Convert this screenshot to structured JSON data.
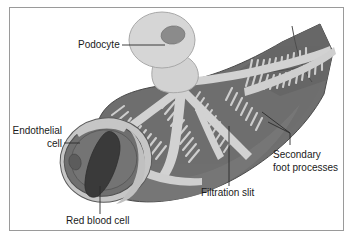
{
  "figure": {
    "frame": {
      "border_color": "#9a9a9a",
      "background": "#ffffff"
    }
  },
  "palette": {
    "capillary_dark": "#6f6f6f",
    "capillary_dark_shade": "#5e5e5e",
    "podocyte_light": "#d2d2d2",
    "podocyte_light_alt": "#c9c9c9",
    "nucleus": "#8b8b8b",
    "endothelium_ring": "#c4c4c4",
    "lumen_mid": "#7a7a7a",
    "red_blood_cell": "#3a3a3a",
    "outline": "#4a4a4a",
    "text": "#1a1a1a"
  },
  "labels": [
    {
      "id": "podocyte",
      "text": "Podocyte",
      "x": 78,
      "y": 48,
      "anchor": "start",
      "lines": [
        "Podocyte"
      ]
    },
    {
      "id": "endothelial-cell",
      "text": "Endothelial cell",
      "x": 62,
      "y": 128,
      "anchor": "end",
      "lines": [
        "Endothelial",
        "cell"
      ]
    },
    {
      "id": "red-blood-cell",
      "text": "Red blood cell",
      "x": 66,
      "y": 224,
      "anchor": "start",
      "lines": [
        "Red blood cell"
      ]
    },
    {
      "id": "filtration-slit",
      "text": "Filtration slit",
      "x": 201,
      "y": 194,
      "anchor": "start",
      "lines": [
        "Filtration slit"
      ]
    },
    {
      "id": "secondary-foot-processes",
      "text": "Secondary foot processes",
      "x": 271,
      "y": 158,
      "anchor": "start",
      "lines": [
        "Secondary",
        "foot processes"
      ]
    }
  ],
  "label_text": {
    "podocyte": "Podocyte",
    "endothelial_line1": "Endothelial",
    "endothelial_line2": "cell",
    "red_blood_cell": "Red blood cell",
    "filtration_slit": "Filtration slit",
    "secondary_line1": "Secondary",
    "secondary_line2": "foot processes"
  }
}
